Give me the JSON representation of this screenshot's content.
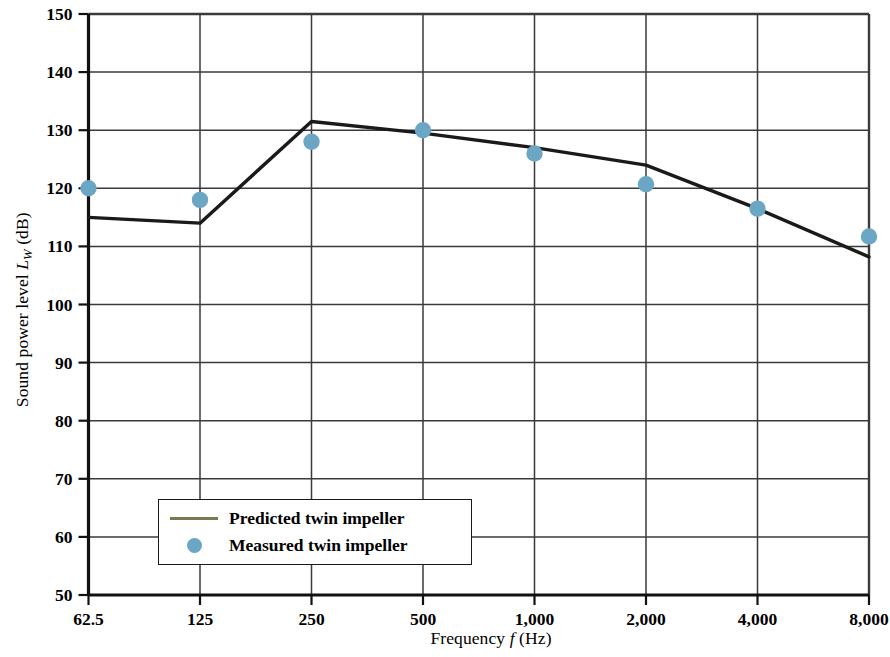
{
  "chart_data": {
    "type": "line",
    "title": "",
    "xlabel": "Frequency f (Hz)",
    "ylabel": "Sound power level L_W (dB)",
    "xlabel_parts": {
      "prefix": "Frequency ",
      "italic": "f",
      "suffix": " (Hz)"
    },
    "ylabel_parts": {
      "prefix": "Sound power level ",
      "italic": "L",
      "subscript": "W",
      "suffix": " (dB)"
    },
    "categories": [
      "62.5",
      "125",
      "250",
      "500",
      "1,000",
      "2,000",
      "4,000",
      "8,000"
    ],
    "x_values_hz": [
      62.5,
      125,
      250,
      500,
      1000,
      2000,
      4000,
      8000
    ],
    "x_tick_labels": [
      "62.5",
      "125",
      "250",
      "500",
      "1,000",
      "2,000",
      "4,000",
      "8,000"
    ],
    "y_tick_labels": [
      "50",
      "60",
      "70",
      "80",
      "90",
      "100",
      "110",
      "120",
      "130",
      "140",
      "150"
    ],
    "y_tick_values": [
      50,
      60,
      70,
      80,
      90,
      100,
      110,
      120,
      130,
      140,
      150
    ],
    "ylim": [
      50,
      150
    ],
    "grid": true,
    "legend_position": "lower-left-inside",
    "series": [
      {
        "name": "Predicted twin impeller",
        "style": "line",
        "color": "#1a1a1a",
        "legend_swatch_color": "#7b7a4e",
        "values": [
          115.0,
          114.0,
          131.5,
          129.5,
          127.0,
          124.0,
          116.5,
          108.2
        ]
      },
      {
        "name": "Measured twin impeller",
        "style": "marker",
        "color": "#6ba6c4",
        "values": [
          120.0,
          118.0,
          128.0,
          130.0,
          126.0,
          120.7,
          116.5,
          111.7
        ]
      }
    ]
  },
  "legend": {
    "entries": [
      {
        "label": "Predicted twin impeller"
      },
      {
        "label": "Measured twin impeller"
      }
    ]
  },
  "colors": {
    "marker": "#6ba6c4",
    "line": "#1a1a1a",
    "legend_line": "#7b7a4e",
    "grid": "#3a3a3a",
    "axis": "#111111"
  }
}
